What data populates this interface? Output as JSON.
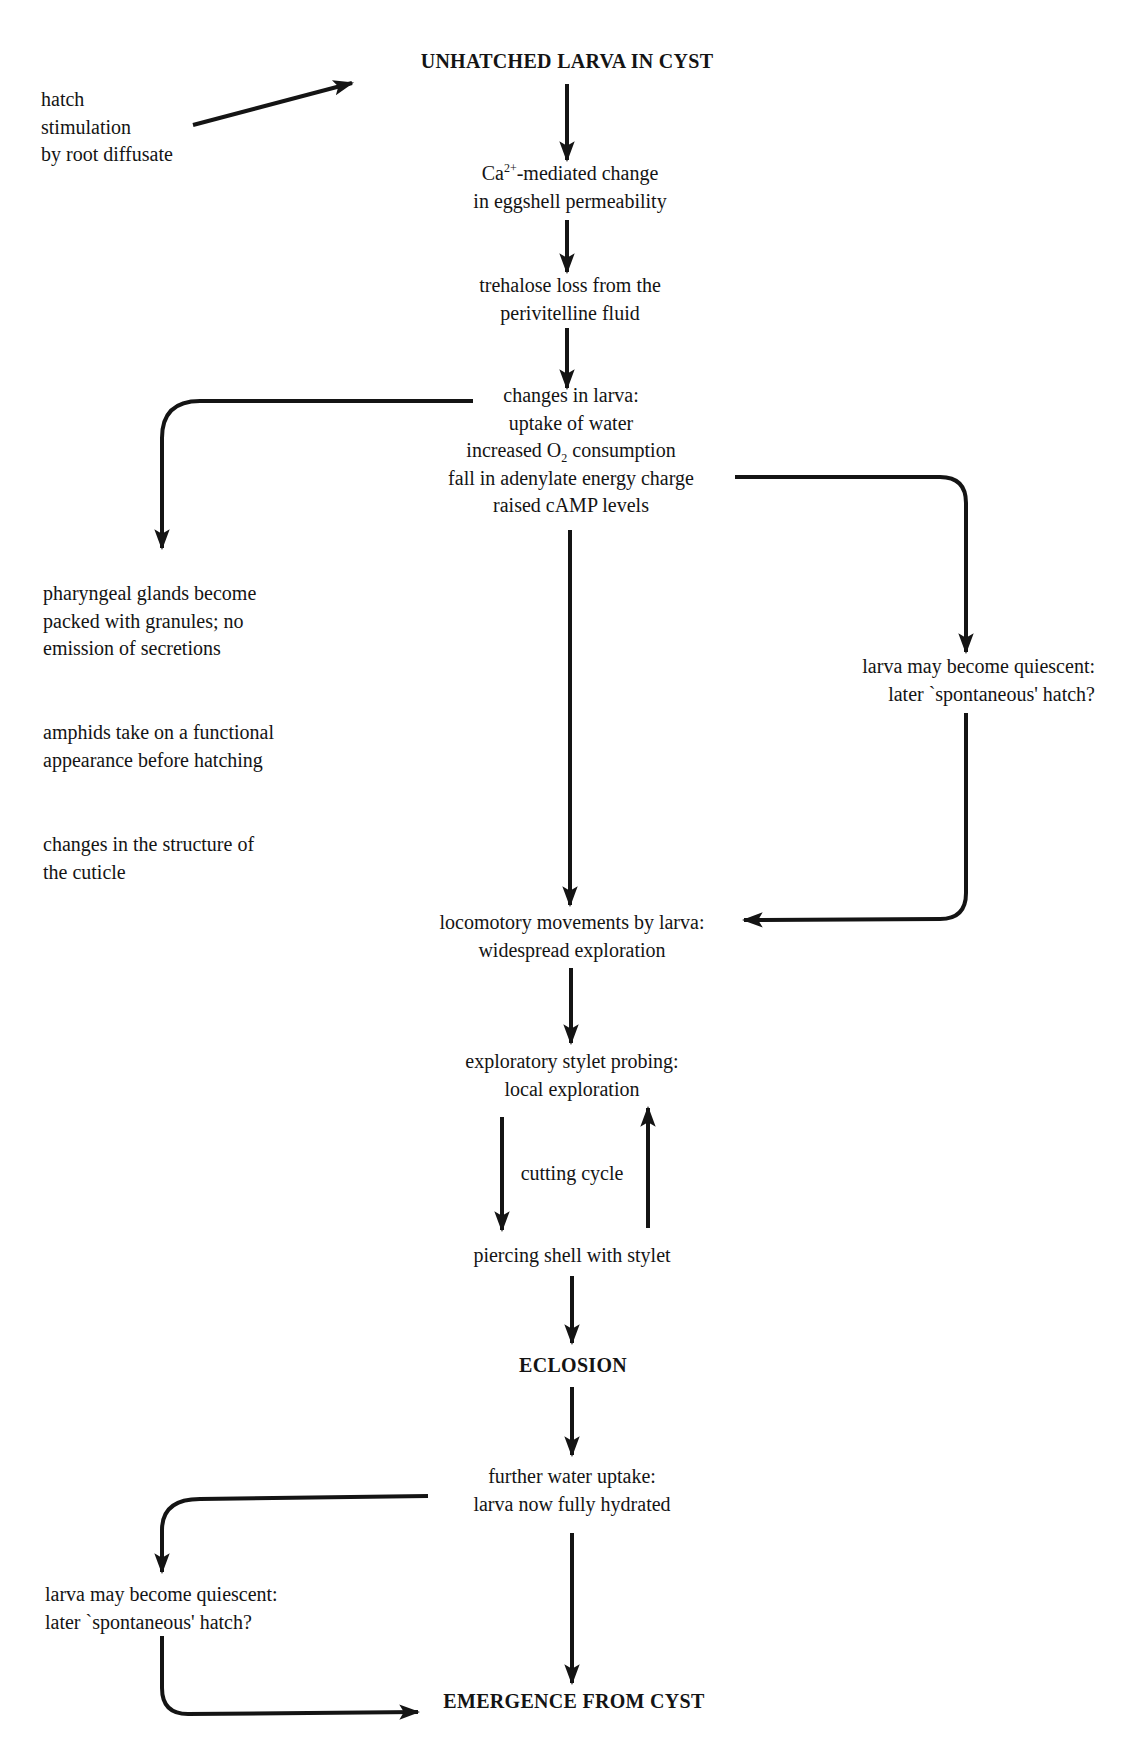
{
  "diagram": {
    "nodes": {
      "start": {
        "label": "UNHATCHED LARVA IN CYST"
      },
      "stimulus": {
        "lines": [
          "hatch",
          "stimulation",
          "by root diffusate"
        ]
      },
      "calcium": {
        "prefix": "Ca",
        "superscript": "2+",
        "suffix": "-mediated change",
        "line2": "in eggshell permeability"
      },
      "trehalose": {
        "lines": [
          "trehalose loss from the",
          "perivitelline fluid"
        ]
      },
      "larva_changes": {
        "line1": "changes in larva:",
        "line2": "uptake of water",
        "line3_prefix": "increased O",
        "line3_subscript": "2",
        "line3_suffix": " consumption",
        "line4": "fall in adenylate energy charge",
        "line5": "raised cAMP levels"
      },
      "left_effects": [
        {
          "lines": [
            "pharyngeal glands become",
            "packed with granules; no",
            "emission of secretions"
          ]
        },
        {
          "lines": [
            "amphids take on a functional",
            "appearance before hatching"
          ]
        },
        {
          "lines": [
            "changes in the structure of",
            "the cuticle"
          ]
        }
      ],
      "quiescent_right": {
        "lines": [
          "larva may become quiescent:",
          "later `spontaneous' hatch?"
        ]
      },
      "locomotory": {
        "lines": [
          "locomotory movements by larva:",
          "widespread exploration"
        ]
      },
      "exploratory": {
        "lines": [
          "exploratory stylet probing:",
          "local exploration"
        ]
      },
      "cutting_cycle": {
        "label": "cutting cycle"
      },
      "piercing": {
        "label": "piercing shell with stylet"
      },
      "eclosion": {
        "label": "ECLOSION"
      },
      "water_uptake": {
        "lines": [
          "further water uptake:",
          "larva now fully hydrated"
        ]
      },
      "quiescent_left": {
        "lines": [
          "larva may become quiescent:",
          "later `spontaneous' hatch?"
        ]
      },
      "end": {
        "label": "EMERGENCE FROM CYST"
      }
    },
    "edges": [
      {
        "from": "stimulus",
        "to": "start"
      },
      {
        "from": "start",
        "to": "calcium"
      },
      {
        "from": "calcium",
        "to": "trehalose"
      },
      {
        "from": "trehalose",
        "to": "larva_changes"
      },
      {
        "from": "larva_changes",
        "to": "left_effects"
      },
      {
        "from": "larva_changes",
        "to": "quiescent_right"
      },
      {
        "from": "larva_changes",
        "to": "locomotory"
      },
      {
        "from": "quiescent_right",
        "to": "locomotory"
      },
      {
        "from": "locomotory",
        "to": "exploratory"
      },
      {
        "from": "exploratory",
        "to": "piercing",
        "label": "cutting cycle"
      },
      {
        "from": "piercing",
        "to": "exploratory",
        "label": "cutting cycle"
      },
      {
        "from": "piercing",
        "to": "eclosion"
      },
      {
        "from": "eclosion",
        "to": "water_uptake"
      },
      {
        "from": "water_uptake",
        "to": "quiescent_left"
      },
      {
        "from": "water_uptake",
        "to": "end"
      },
      {
        "from": "quiescent_left",
        "to": "end"
      }
    ],
    "colors": {
      "ink": "#141414",
      "background": "#ffffff"
    }
  }
}
